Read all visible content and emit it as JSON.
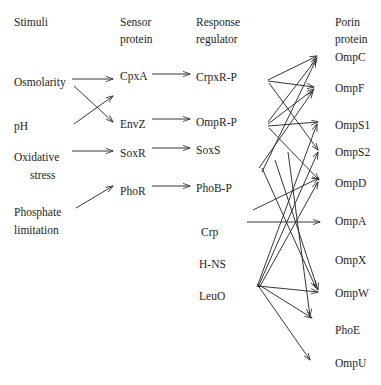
{
  "figure": {
    "type": "network-diagram",
    "background_color": "#ffffff",
    "line_color": "#2a2a2a"
  },
  "columns": [
    {
      "id": "stimuli",
      "header_line1": "Stimuli",
      "header_line2": "",
      "x": 14,
      "header_y": 22
    },
    {
      "id": "sensor",
      "header_line1": "Sensor",
      "header_line2": "protein",
      "x": 120,
      "header_y": 22
    },
    {
      "id": "regulator",
      "header_line1": "Response",
      "header_line2": "regulator",
      "x": 196,
      "header_y": 22
    },
    {
      "id": "porin",
      "header_line1": "Porin",
      "header_line2": "protein",
      "x": 335,
      "header_y": 22
    }
  ],
  "nodes": {
    "stimuli": [
      {
        "id": "osmolarity",
        "label": "Osmolarity",
        "x": 14,
        "y": 83
      },
      {
        "id": "ph",
        "label": "pH",
        "x": 14,
        "y": 127
      },
      {
        "id": "oxidative",
        "label": "Oxidative",
        "x": 14,
        "y": 158
      },
      {
        "id": "stress",
        "label": "stress",
        "x": 30,
        "y": 176
      },
      {
        "id": "phosphate",
        "label": "Phosphate",
        "x": 14,
        "y": 213
      },
      {
        "id": "limitation",
        "label": "limitation",
        "x": 14,
        "y": 231
      }
    ],
    "sensor": [
      {
        "id": "cpxa",
        "label": "CpxA",
        "x": 120,
        "y": 77
      },
      {
        "id": "envz",
        "label": "EnvZ",
        "x": 120,
        "y": 125
      },
      {
        "id": "soxr",
        "label": "SoxR",
        "x": 120,
        "y": 154
      },
      {
        "id": "phor",
        "label": "PhoR",
        "x": 120,
        "y": 192
      }
    ],
    "regulator": [
      {
        "id": "crpxr-p",
        "label": "CrpxR-P",
        "x": 196,
        "y": 78
      },
      {
        "id": "ompr-p",
        "label": "OmpR-P",
        "x": 196,
        "y": 123
      },
      {
        "id": "soxs",
        "label": "SoxS",
        "x": 196,
        "y": 151
      },
      {
        "id": "phob-p",
        "label": "PhoB-P",
        "x": 196,
        "y": 189
      },
      {
        "id": "crp",
        "label": "Crp",
        "x": 201,
        "y": 233
      },
      {
        "id": "h-ns",
        "label": "H-NS",
        "x": 199,
        "y": 265
      },
      {
        "id": "leuo",
        "label": "LeuO",
        "x": 199,
        "y": 297
      }
    ],
    "porin": [
      {
        "id": "ompc",
        "label": "OmpC",
        "x": 335,
        "y": 58
      },
      {
        "id": "ompf",
        "label": "OmpF",
        "x": 335,
        "y": 89
      },
      {
        "id": "omps1",
        "label": "OmpS1",
        "x": 335,
        "y": 126
      },
      {
        "id": "omps2",
        "label": "OmpS2",
        "x": 335,
        "y": 153
      },
      {
        "id": "ompd",
        "label": "OmpD",
        "x": 335,
        "y": 184
      },
      {
        "id": "ompa",
        "label": "OmpA",
        "x": 335,
        "y": 222
      },
      {
        "id": "ompx",
        "label": "OmpX",
        "x": 335,
        "y": 261
      },
      {
        "id": "ompw",
        "label": "OmpW",
        "x": 335,
        "y": 294
      },
      {
        "id": "phoe",
        "label": "PhoE",
        "x": 335,
        "y": 331
      },
      {
        "id": "ompu",
        "label": "OmpU",
        "x": 335,
        "y": 364
      }
    ]
  },
  "edges": [
    {
      "from": "osmolarity",
      "to": "cpxa",
      "x1": 72,
      "y1": 79,
      "x2": 113,
      "y2": 79
    },
    {
      "from": "osmolarity",
      "to": "envz",
      "x1": 74,
      "y1": 86,
      "x2": 113,
      "y2": 122
    },
    {
      "from": "ph",
      "to": "cpxa",
      "x1": 74,
      "y1": 124,
      "x2": 113,
      "y2": 96
    },
    {
      "from": "oxidative",
      "to": "soxr",
      "x1": 72,
      "y1": 151,
      "x2": 113,
      "y2": 151
    },
    {
      "from": "phosphate",
      "to": "phor",
      "x1": 76,
      "y1": 208,
      "x2": 113,
      "y2": 186
    },
    {
      "from": "cpxa",
      "to": "crpxr-p",
      "x1": 152,
      "y1": 74,
      "x2": 190,
      "y2": 74
    },
    {
      "from": "envz",
      "to": "ompr-p",
      "x1": 152,
      "y1": 119,
      "x2": 190,
      "y2": 119
    },
    {
      "from": "soxr",
      "to": "soxs",
      "x1": 152,
      "y1": 148,
      "x2": 190,
      "y2": 148
    },
    {
      "from": "phor",
      "to": "phob-p",
      "x1": 152,
      "y1": 186,
      "x2": 190,
      "y2": 186
    },
    {
      "from": "crpxr-p",
      "to": "ompc",
      "x1": 268,
      "y1": 80,
      "x2": 317,
      "y2": 56
    },
    {
      "from": "crpxr-p",
      "to": "ompf",
      "x1": 268,
      "y1": 81,
      "x2": 314,
      "y2": 87
    },
    {
      "from": "crpxr-p",
      "to": "omps2",
      "x1": 269,
      "y1": 83,
      "x2": 318,
      "y2": 150
    },
    {
      "from": "ompr-p",
      "to": "ompc",
      "x1": 268,
      "y1": 122,
      "x2": 317,
      "y2": 58
    },
    {
      "from": "ompr-p",
      "to": "ompf",
      "x1": 268,
      "y1": 124,
      "x2": 314,
      "y2": 89
    },
    {
      "from": "ompr-p",
      "to": "omps1",
      "x1": 268,
      "y1": 126,
      "x2": 318,
      "y2": 122
    },
    {
      "from": "ompr-p",
      "to": "ompd",
      "x1": 269,
      "y1": 128,
      "x2": 319,
      "y2": 180
    },
    {
      "from": "soxs",
      "to": "ompf",
      "x1": 259,
      "y1": 168,
      "x2": 313,
      "y2": 91
    },
    {
      "from": "soxs",
      "to": "ompc",
      "x1": 262,
      "y1": 172,
      "x2": 316,
      "y2": 60
    },
    {
      "from": "crp",
      "to": "ompa",
      "x1": 247,
      "y1": 222,
      "x2": 320,
      "y2": 222
    },
    {
      "from": "crp",
      "to": "omps1",
      "x1": 257,
      "y1": 287,
      "x2": 317,
      "y2": 124
    },
    {
      "from": "crp",
      "to": "omps2",
      "x1": 258,
      "y1": 287,
      "x2": 318,
      "y2": 152
    },
    {
      "from": "h-ns",
      "to": "ompd",
      "x1": 259,
      "y1": 288,
      "x2": 318,
      "y2": 182
    },
    {
      "from": "h-ns",
      "to": "ompw",
      "x1": 258,
      "y1": 286,
      "x2": 318,
      "y2": 292
    },
    {
      "from": "h-ns",
      "to": "phoe",
      "x1": 259,
      "y1": 285,
      "x2": 312,
      "y2": 318
    },
    {
      "from": "leuo",
      "to": "ompu",
      "x1": 257,
      "y1": 284,
      "x2": 310,
      "y2": 360
    },
    {
      "from": "crp",
      "to": "ompd",
      "x1": 253,
      "y1": 210,
      "x2": 319,
      "y2": 178
    },
    {
      "from": "h-ns",
      "to": "ompw",
      "x1": 275,
      "y1": 160,
      "x2": 318,
      "y2": 290
    },
    {
      "from": "h-ns",
      "to": "phoe",
      "x1": 288,
      "y1": 152,
      "x2": 310,
      "y2": 316
    },
    {
      "from": "crp",
      "to": "ompw",
      "x1": 262,
      "y1": 168,
      "x2": 316,
      "y2": 288
    }
  ]
}
